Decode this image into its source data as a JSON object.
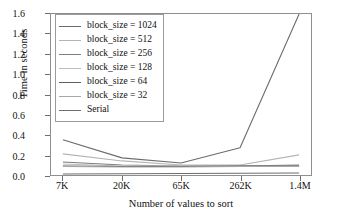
{
  "chart_data": {
    "type": "line",
    "title": "",
    "xlabel": "Number of values to sort",
    "ylabel": "Time in seconds",
    "categories": [
      "7K",
      "20K",
      "65K",
      "262K",
      "1.4M"
    ],
    "ylim": [
      0.0,
      1.6
    ],
    "yticks": [
      "0.0",
      "0.2",
      "0.4",
      "0.6",
      "0.8",
      "1.0",
      "1.2",
      "1.4",
      "1.6"
    ],
    "ytick_values": [
      0.0,
      0.2,
      0.4,
      0.6,
      0.8,
      1.0,
      1.2,
      1.4,
      1.6
    ],
    "grid": false,
    "legend_position": "upper left (inside axes)",
    "series": [
      {
        "name": "block_size = 1024",
        "color": "#6b6b6b",
        "values": [
          0.35,
          0.17,
          0.12,
          0.27,
          1.6
        ]
      },
      {
        "name": "block_size = 512",
        "color": "#b4b4b4",
        "values": [
          0.21,
          0.14,
          0.1,
          0.1,
          0.2
        ]
      },
      {
        "name": "block_size = 256",
        "color": "#7d7d7d",
        "values": [
          0.13,
          0.1,
          0.09,
          0.09,
          0.1
        ]
      },
      {
        "name": "block_size = 128",
        "color": "#bdbdbd",
        "values": [
          0.11,
          0.09,
          0.09,
          0.09,
          0.09
        ]
      },
      {
        "name": "block_size = 64",
        "color": "#5f5f5f",
        "values": [
          0.09,
          0.085,
          0.085,
          0.09,
          0.09
        ]
      },
      {
        "name": "block_size = 32",
        "color": "#a8a8a8",
        "values": [
          0.085,
          0.08,
          0.08,
          0.085,
          0.085
        ]
      },
      {
        "name": "Serial",
        "color": "#6e6e6e",
        "values": [
          0.01,
          0.012,
          0.015,
          0.018,
          0.02
        ]
      }
    ]
  },
  "legend": {
    "entries": [
      {
        "label": "block_size = 1024"
      },
      {
        "label": "block_size = 512"
      },
      {
        "label": "block_size = 256"
      },
      {
        "label": "block_size = 128"
      },
      {
        "label": "block_size = 64"
      },
      {
        "label": "block_size = 32"
      },
      {
        "label": "Serial"
      }
    ]
  }
}
